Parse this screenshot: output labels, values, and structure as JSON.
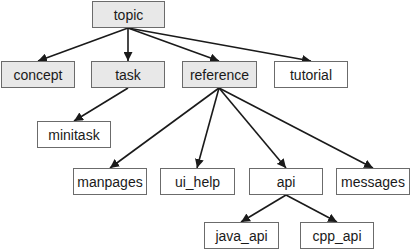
{
  "diagram": {
    "type": "tree",
    "colors": {
      "shaded_fill": "#e8e8e8",
      "plain_fill": "#ffffff",
      "border": "#6b6b6b",
      "edge": "#1a1a1a"
    },
    "nodes": [
      {
        "id": "topic",
        "label": "topic",
        "shaded": true,
        "x": 92,
        "y": 1,
        "w": 73,
        "h": 27
      },
      {
        "id": "concept",
        "label": "concept",
        "shaded": true,
        "x": 1,
        "y": 61,
        "w": 74,
        "h": 27
      },
      {
        "id": "task",
        "label": "task",
        "shaded": true,
        "x": 91,
        "y": 61,
        "w": 74,
        "h": 27
      },
      {
        "id": "reference",
        "label": "reference",
        "shaded": true,
        "x": 182,
        "y": 61,
        "w": 75,
        "h": 27
      },
      {
        "id": "tutorial",
        "label": "tutorial",
        "shaded": false,
        "x": 274,
        "y": 61,
        "w": 74,
        "h": 27
      },
      {
        "id": "minitask",
        "label": "minitask",
        "shaded": false,
        "x": 37,
        "y": 121,
        "w": 74,
        "h": 27
      },
      {
        "id": "manpages",
        "label": "manpages",
        "shaded": false,
        "x": 73,
        "y": 168,
        "w": 74,
        "h": 27
      },
      {
        "id": "ui_help",
        "label": "ui_help",
        "shaded": false,
        "x": 160,
        "y": 168,
        "w": 75,
        "h": 27
      },
      {
        "id": "api",
        "label": "api",
        "shaded": false,
        "x": 249,
        "y": 168,
        "w": 74,
        "h": 27
      },
      {
        "id": "messages",
        "label": "messages",
        "shaded": false,
        "x": 336,
        "y": 168,
        "w": 74,
        "h": 27
      },
      {
        "id": "java_api",
        "label": "java_api",
        "shaded": false,
        "x": 204,
        "y": 222,
        "w": 75,
        "h": 27
      },
      {
        "id": "cpp_api",
        "label": "cpp_api",
        "shaded": false,
        "x": 300,
        "y": 222,
        "w": 74,
        "h": 27
      }
    ],
    "edges": [
      {
        "from": "topic",
        "to": "concept",
        "x1": 128,
        "y1": 28,
        "x2": 38,
        "y2": 61
      },
      {
        "from": "topic",
        "to": "task",
        "x1": 128,
        "y1": 28,
        "x2": 128,
        "y2": 61
      },
      {
        "from": "topic",
        "to": "reference",
        "x1": 128,
        "y1": 28,
        "x2": 219,
        "y2": 61
      },
      {
        "from": "topic",
        "to": "tutorial",
        "x1": 128,
        "y1": 28,
        "x2": 311,
        "y2": 61
      },
      {
        "from": "task",
        "to": "minitask",
        "x1": 128,
        "y1": 88,
        "x2": 74,
        "y2": 121
      },
      {
        "from": "reference",
        "to": "manpages",
        "x1": 219,
        "y1": 88,
        "x2": 110,
        "y2": 168
      },
      {
        "from": "reference",
        "to": "ui_help",
        "x1": 219,
        "y1": 88,
        "x2": 197,
        "y2": 168
      },
      {
        "from": "reference",
        "to": "api",
        "x1": 219,
        "y1": 88,
        "x2": 286,
        "y2": 168
      },
      {
        "from": "reference",
        "to": "messages",
        "x1": 219,
        "y1": 88,
        "x2": 373,
        "y2": 168
      },
      {
        "from": "api",
        "to": "java_api",
        "x1": 286,
        "y1": 195,
        "x2": 241,
        "y2": 222
      },
      {
        "from": "api",
        "to": "cpp_api",
        "x1": 286,
        "y1": 195,
        "x2": 337,
        "y2": 222
      }
    ]
  }
}
